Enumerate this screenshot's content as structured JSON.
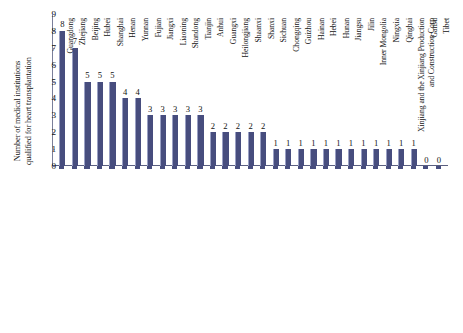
{
  "chart_data": {
    "type": "bar",
    "title": "",
    "subtitle": "",
    "xlabel": "",
    "ylabel": "Number of medical institutions qualified for heart transplantation",
    "ylabel_lines": [
      "Number of medical institutions",
      "qualified for heart transplantation"
    ],
    "ylim": [
      0,
      9
    ],
    "ytick_labels": [
      "9",
      "8",
      "7",
      "6",
      "5",
      "4",
      "3",
      "2",
      "1",
      "0"
    ],
    "ytick_values": [
      9,
      8,
      7,
      6,
      5,
      4,
      3,
      2,
      1,
      0
    ],
    "grid": false,
    "legend": false,
    "legend_position": "none",
    "bar_color": "#474d7e",
    "categories": [
      "Guangdong",
      "Zhejiang",
      "Beijing",
      "Hubei",
      "Shanghai",
      "Henan",
      "Yunnan",
      "Fujian",
      "Jiangxi",
      "Liaoning",
      "Shandong",
      "Tianjin",
      "Anhui",
      "Guangxi",
      "Heilongjiang",
      "Shaanxi",
      "Shanxi",
      "Sichuan",
      "Chongqing",
      "Guizhou",
      "Hainan",
      "Hebei",
      "Hunan",
      "Jiangsu",
      "Jilin",
      "Inner Mongolia",
      "Ningxia",
      "Qinghai",
      "Xinjiang and the Xinjiang Production and Construction Corp",
      "Gansu",
      "Tibet"
    ],
    "category_label_lines": {
      "Xinjiang and the Xinjiang Production and Construction Corp": [
        "Xinjiang and the Xinjiang Production",
        "and Construction Corp"
      ]
    },
    "values": [
      8,
      7,
      5,
      5,
      5,
      4,
      4,
      3,
      3,
      3,
      3,
      3,
      2,
      2,
      2,
      2,
      2,
      1,
      1,
      1,
      1,
      1,
      1,
      1,
      1,
      1,
      1,
      1,
      1,
      0,
      0
    ],
    "data_labels": [
      "8",
      "7",
      "5",
      "5",
      "5",
      "4",
      "4",
      "3",
      "3",
      "3",
      "3",
      "3",
      "2",
      "2",
      "2",
      "2",
      "2",
      "1",
      "1",
      "1",
      "1",
      "1",
      "1",
      "1",
      "1",
      "1",
      "1",
      "1",
      "1",
      "0",
      "0"
    ]
  }
}
